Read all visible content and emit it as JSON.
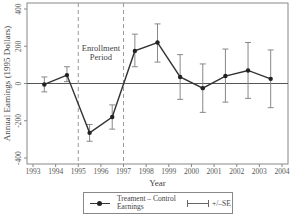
{
  "chart_data": {
    "type": "line",
    "title": "",
    "xlabel": "Year",
    "ylabel": "Annual Earnings (1995 Dollars)",
    "xlim": [
      1993,
      2004
    ],
    "ylim": [
      -400,
      400
    ],
    "x_ticks": [
      "1993",
      "1994",
      "1995",
      "1996",
      "1997",
      "1998",
      "1999",
      "2000",
      "2001",
      "2002",
      "2003",
      "2004"
    ],
    "y_ticks": [
      "-400",
      "-200",
      "0",
      "200",
      "400"
    ],
    "grid": false,
    "reference_line_y": 0,
    "annotation": {
      "text_line1": "Enrollment",
      "text_line2": "Period",
      "x_start": 1995,
      "x_end": 1997,
      "style": "dashed vertical lines"
    },
    "x": [
      1993.5,
      1994.5,
      1995.5,
      1996.5,
      1997.5,
      1998.5,
      1999.5,
      2000.5,
      2001.5,
      2002.5,
      2003.5
    ],
    "series": [
      {
        "name": "Treament – Control Earnings",
        "values": [
          -5,
          45,
          -265,
          -180,
          175,
          220,
          35,
          -25,
          40,
          70,
          25
        ],
        "upper": [
          35,
          90,
          -220,
          -115,
          265,
          320,
          155,
          105,
          185,
          220,
          180
        ],
        "lower": [
          -45,
          10,
          -310,
          -245,
          90,
          115,
          -85,
          -155,
          -100,
          -80,
          -130
        ]
      }
    ],
    "legend": {
      "position": "bottom",
      "entries": [
        "Treament – Control Earnings",
        "+/–SE"
      ]
    }
  },
  "legend": {
    "series_label": "Treament – Control Earnings",
    "se_label": "+/–SE"
  }
}
